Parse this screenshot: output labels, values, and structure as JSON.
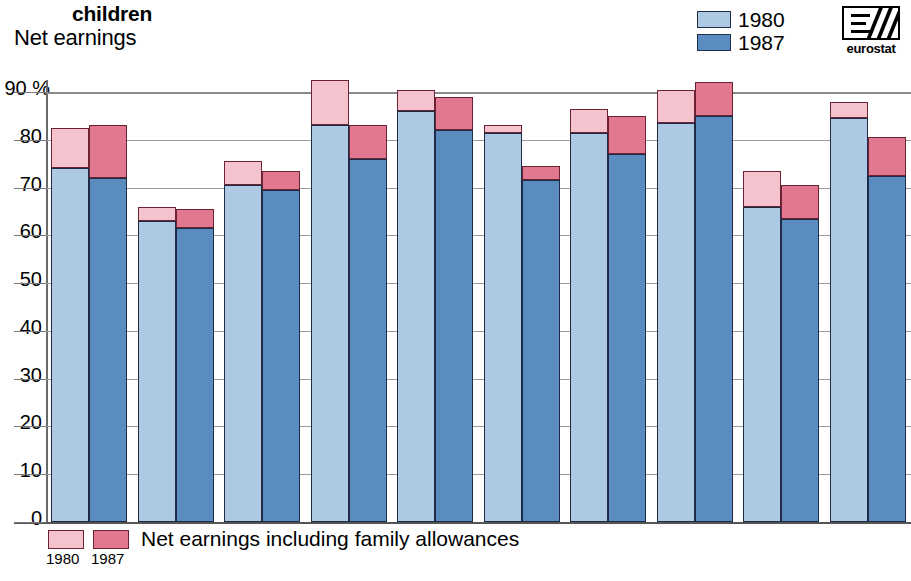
{
  "header": {
    "title_small": "children",
    "title_main": "Net earnings"
  },
  "legend_top": {
    "items": [
      {
        "label": "1980",
        "color": "#aec9e4"
      },
      {
        "label": "1987",
        "color": "#5a8cc0"
      }
    ]
  },
  "legend_bottom": {
    "text": "Net earnings including family allowances",
    "year_1980": "1980",
    "year_1987": "1987",
    "color_1980": "#f5c3ce",
    "color_1987": "#e0788f"
  },
  "logo": {
    "text": "eurostat"
  },
  "chart_data": {
    "type": "bar",
    "subtype": "grouped-stacked",
    "title": "Net earnings",
    "subtitle": "children",
    "xlabel": "",
    "ylabel": "",
    "unit": "%",
    "axis_unit_label": "90 %",
    "ylim": [
      0,
      90
    ],
    "yticks": [
      0,
      10,
      20,
      30,
      40,
      50,
      60,
      70,
      80,
      90
    ],
    "ytick_labels": [
      "0",
      "10",
      "20",
      "30",
      "40",
      "50",
      "60",
      "70",
      "80",
      "90 %"
    ],
    "grid": true,
    "legend_position": "top-right",
    "series": [
      {
        "name": "1980",
        "stack_label": "Net earnings",
        "color": "#aec9e4",
        "values": [
          74.0,
          63.0,
          70.5,
          83.0,
          86.0,
          81.5,
          81.5,
          83.5,
          66.0,
          84.5
        ]
      },
      {
        "name": "1980 allowances",
        "stack_label": "Net earnings including family allowances",
        "color": "#f5c3ce",
        "values": [
          82.5,
          66.0,
          75.5,
          92.5,
          90.5,
          83.0,
          86.5,
          90.5,
          73.5,
          88.0
        ]
      },
      {
        "name": "1987",
        "stack_label": "Net earnings",
        "color": "#5a8cc0",
        "values": [
          72.0,
          61.5,
          69.5,
          76.0,
          82.0,
          71.5,
          77.0,
          85.0,
          63.5,
          72.5
        ]
      },
      {
        "name": "1987 allowances",
        "stack_label": "Net earnings including family allowances",
        "color": "#e0788f",
        "values": [
          83.0,
          65.5,
          73.5,
          83.0,
          89.0,
          74.5,
          85.0,
          92.0,
          70.5,
          80.5
        ]
      }
    ],
    "categories": [
      "",
      "",
      "",
      "",
      "",
      "",
      "",
      "",
      "",
      ""
    ],
    "group_count": 10
  }
}
